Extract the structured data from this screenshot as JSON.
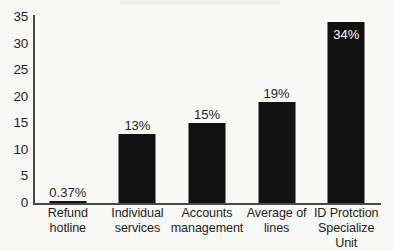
{
  "chart_data": {
    "type": "bar",
    "title": "",
    "xlabel": "",
    "ylabel": "",
    "categories": [
      "Refund hotline",
      "Individual services",
      "Accounts management",
      "Average of lines",
      "ID Protction Specialize Unit"
    ],
    "category_lines": [
      [
        "Refund",
        "hotline"
      ],
      [
        "Individual",
        "services"
      ],
      [
        "Accounts",
        "management"
      ],
      [
        "Average of",
        "lines"
      ],
      [
        "ID Protction",
        "Specialize Unit"
      ]
    ],
    "values": [
      0.37,
      13,
      15,
      19,
      34
    ],
    "data_labels": [
      "0.37%",
      "13%",
      "15%",
      "19%",
      "34%"
    ],
    "label_placement": [
      "outside",
      "outside",
      "outside",
      "outside",
      "inside"
    ],
    "ylim": [
      0,
      35
    ],
    "yticks": [
      0,
      5,
      10,
      15,
      20,
      25,
      30,
      35
    ],
    "ytick_labels": [
      "0",
      "5",
      "10",
      "15",
      "20",
      "25",
      "30",
      "35"
    ],
    "grid": false,
    "legend": false,
    "bar_color": "#111111",
    "axis_color": "#4a4a4a",
    "background": "#f8f8f6",
    "inside_label_color": "#ffffff"
  }
}
